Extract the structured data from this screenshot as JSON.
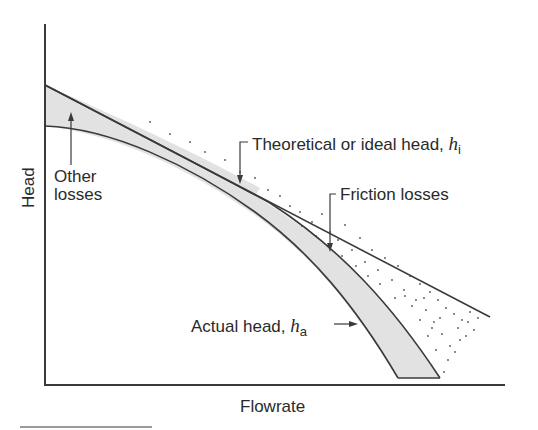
{
  "diagram": {
    "axes": {
      "x_label": "Flowrate",
      "y_label": "Head"
    },
    "labels": {
      "theoretical": {
        "text": "Theoretical or ideal head, ",
        "var": "h",
        "sub": "i"
      },
      "friction": {
        "text": "Friction losses"
      },
      "other": {
        "line1": "Other",
        "line2": "losses"
      },
      "actual": {
        "text": "Actual head, ",
        "var": "h",
        "sub": "a"
      }
    },
    "colors": {
      "line": "#3a3a3a",
      "shade": "#e2e2e2",
      "dots": "#555555",
      "rule": "#9a9a9a"
    }
  }
}
